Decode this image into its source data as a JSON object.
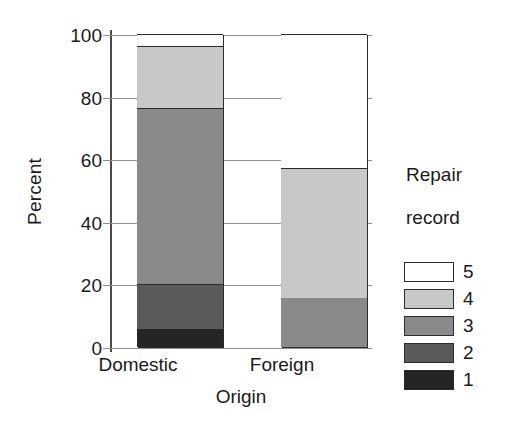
{
  "chart_data": {
    "type": "bar",
    "subtype": "stacked-percent",
    "title": "",
    "xlabel": "Origin",
    "ylabel": "Percent",
    "categories": [
      "Domestic",
      "Foreign"
    ],
    "ylim": [
      0,
      100
    ],
    "yticks": [
      0,
      20,
      40,
      60,
      80,
      100
    ],
    "ytick_labels": [
      "0",
      "20",
      "40",
      "60",
      "80",
      "100"
    ],
    "grid": true,
    "grid_axis": "y",
    "legend_title": "Repair\nrecord",
    "legend_position": "right",
    "stack_order_bottom_to_top": [
      "1",
      "2",
      "3",
      "4",
      "5"
    ],
    "series": [
      {
        "name": "1",
        "label": "1",
        "color": "#252525",
        "values": [
          5.8,
          0
        ]
      },
      {
        "name": "2",
        "label": "2",
        "color": "#5a5a5a",
        "values": [
          14.3,
          0
        ]
      },
      {
        "name": "3",
        "label": "3",
        "color": "#8a8a8a",
        "values": [
          56.3,
          15.7
        ]
      },
      {
        "name": "4",
        "label": "4",
        "color": "#c8c8c8",
        "values": [
          19.8,
          41.5
        ]
      },
      {
        "name": "5",
        "label": "5",
        "color": "#ffffff",
        "values": [
          3.8,
          42.8
        ]
      }
    ],
    "cumulative_tops": {
      "Domestic": [
        5.8,
        20.1,
        76.4,
        96.2,
        100
      ],
      "Foreign": [
        0,
        0,
        15.7,
        57.2,
        100
      ]
    }
  },
  "axes": {
    "y_label": "Percent",
    "x_label": "Origin",
    "y_ticks": [
      "100",
      "80",
      "60",
      "40",
      "20",
      "0"
    ],
    "x_ticks": [
      "Domestic",
      "Foreign"
    ]
  },
  "legend": {
    "title_line1": "Repair",
    "title_line2": "record",
    "entries": [
      {
        "label": "5",
        "swatch": "#ffffff"
      },
      {
        "label": "4",
        "swatch": "#c8c8c8"
      },
      {
        "label": "3",
        "swatch": "#8a8a8a"
      },
      {
        "label": "2",
        "swatch": "#5a5a5a"
      },
      {
        "label": "1",
        "swatch": "#252525"
      }
    ]
  },
  "colors": {
    "background": "#ffffff",
    "axis": "#4a4a4a",
    "grid": "#8f8f8f",
    "bar_outline": "#2b2b2b",
    "text": "#1a1a1a"
  }
}
